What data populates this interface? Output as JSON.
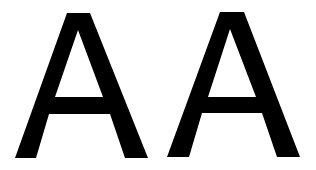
{
  "letters": [
    {
      "char": "A",
      "color": "#000000"
    },
    {
      "char": "A",
      "color": "#000000"
    }
  ],
  "background": "#ffffff"
}
